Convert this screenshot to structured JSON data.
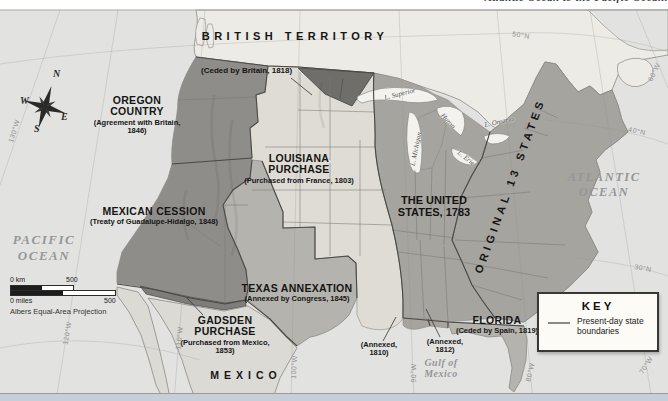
{
  "page": {
    "cropped_caption": "Atlantic Ocean to the Pacific Ocean."
  },
  "regions": {
    "british_territory": {
      "label": "BRITISH TERRITORY"
    },
    "ceded_britain": {
      "label": "(Ceded by Britain, 1818)"
    },
    "oregon": {
      "label": "OREGON COUNTRY",
      "note": "(Agreement with Britain, 1846)"
    },
    "louisiana": {
      "label": "LOUISIANA PURCHASE",
      "note": "(Purchased from France, 1803)"
    },
    "mexican_cession": {
      "label": "MEXICAN CESSION",
      "note": "(Treaty of Guadalupe-Hidalgo, 1848)"
    },
    "texas": {
      "label": "TEXAS ANNEXATION",
      "note": "(Annexed by Congress, 1845)"
    },
    "gadsden": {
      "label": "GADSDEN PURCHASE",
      "note": "(Purchased from Mexico, 1853)"
    },
    "us1783": {
      "label": "THE UNITED STATES, 1783"
    },
    "original13": {
      "label": "ORIGINAL 13 STATES"
    },
    "florida": {
      "label": "FLORIDA",
      "note": "(Ceded by Spain, 1819)"
    },
    "annexed1810": {
      "label": "(Annexed, 1810)"
    },
    "annexed1812": {
      "label": "(Annexed, 1812)"
    },
    "mexico": {
      "label": "MEXICO"
    }
  },
  "water": {
    "pacific": "PACIFIC OCEAN",
    "atlantic": "ATLANTIC OCEAN",
    "gulf": "Gulf of Mexico",
    "lakes": {
      "superior": "L. Superior",
      "michigan": "L. Michigan",
      "huron": "Huron",
      "erie": "L. Erie",
      "ontario": "L. Ontario"
    }
  },
  "graticule": {
    "lat50": "50°N",
    "lat40": "40°N",
    "lat30": "30°N",
    "lon130": "130°W",
    "lon120": "120°W",
    "lon110": "110°W",
    "lon100": "100°W",
    "lon90": "90°W",
    "lon80": "80°W",
    "lon70": "70°W",
    "lon60": "60°W"
  },
  "compass": {
    "n": "N",
    "e": "E",
    "s": "S",
    "w": "W"
  },
  "scalebar": {
    "km_label": "0 km",
    "km_value": "500",
    "miles_label": "0 miles",
    "miles_value": "500",
    "projection": "Albers Equal-Area Projection"
  },
  "key": {
    "title": "KEY",
    "entry": "Present-day state boundaries"
  },
  "colors": {
    "c-ocean": "#e2e3e0",
    "c-canada": "#edebe5",
    "c-mexico": "#dbdad5",
    "c-dark": "#8f8d89",
    "c-wedge": "#6f6e6a",
    "c-lp": "#dedcd4",
    "c-texas": "#b5b3ad",
    "c-us1783": "#a6a49f",
    "c-florida": "#b5b3ad",
    "c-gadsden": "#7f7d79",
    "c-hatch": "#77756f",
    "c-lake": "#f3f2ee",
    "c-border": "#4a4947",
    "c-state": "#7b7974",
    "c-coast": "#8a8a87",
    "c-label": "#151515",
    "c-watertext": "#95969a",
    "c-grid": "#8f908e",
    "c-strip": "#c6cfd8",
    "c-keybg": "#fcfbf6"
  }
}
